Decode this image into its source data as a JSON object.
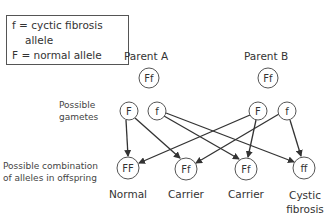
{
  "legend": {
    "line1": "f = cyctic fibrosis",
    "line2": "allele",
    "line3": "F = normal allele"
  },
  "parents": [
    {
      "label": "Parent A",
      "genotype": "Ff"
    },
    {
      "label": "Parent B",
      "genotype": "Ff"
    }
  ],
  "row_labels": {
    "gametes_line1": "Possible",
    "gametes_line2": "gametes",
    "offspring_line1": "Possible combination",
    "offspring_line2": "of alleles in offspring"
  },
  "gametes": [
    {
      "parent": "Parent A",
      "allele": "F"
    },
    {
      "parent": "Parent A",
      "allele": "f"
    },
    {
      "parent": "Parent B",
      "allele": "F"
    },
    {
      "parent": "Parent B",
      "allele": "f"
    }
  ],
  "offspring": [
    {
      "genotype": "FF",
      "phenotype_line1": "Normal",
      "phenotype_line2": ""
    },
    {
      "genotype": "Ff",
      "phenotype_line1": "Carrier",
      "phenotype_line2": ""
    },
    {
      "genotype": "Ff",
      "phenotype_line1": "Carrier",
      "phenotype_line2": ""
    },
    {
      "genotype": "ff",
      "phenotype_line1": "Cystic",
      "phenotype_line2": "fibrosis"
    }
  ],
  "connections": [
    {
      "from": "Parent A F",
      "to": "FF"
    },
    {
      "from": "Parent A F",
      "to": "Ff (1)"
    },
    {
      "from": "Parent A f",
      "to": "Ff (2)"
    },
    {
      "from": "Parent A f",
      "to": "ff"
    },
    {
      "from": "Parent B F",
      "to": "FF"
    },
    {
      "from": "Parent B F",
      "to": "Ff (2)"
    },
    {
      "from": "Parent B f",
      "to": "Ff (1)"
    },
    {
      "from": "Parent B f",
      "to": "ff"
    }
  ],
  "colors": {
    "line": "#333333",
    "circle_stroke": "#555555",
    "text": "#333333"
  }
}
